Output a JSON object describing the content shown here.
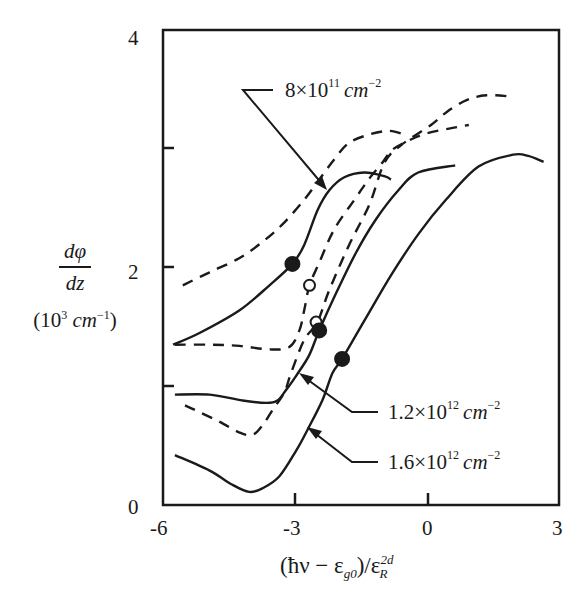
{
  "chart_data": {
    "type": "line",
    "title": "",
    "xlabel": "(ħν − ε_g0)/ε_R^2d",
    "ylabel": "dφ/dz (10^3 cm^-1)",
    "xlim": [
      -6,
      3
    ],
    "ylim": [
      0,
      4
    ],
    "x_ticks": [
      -6,
      -3,
      0,
      3
    ],
    "y_ticks": [
      0,
      1,
      2,
      3,
      4
    ],
    "x_tick_labels": [
      "-6",
      "-3",
      "0",
      "3"
    ],
    "y_tick_labels": [
      "0",
      "",
      "2",
      "",
      "4"
    ],
    "grid": false,
    "legend": "none (inline arrow annotations)",
    "annotations": [
      {
        "text": "8×10^11 cm^-2",
        "points_to": "solid-8e11 / dashed-8e11"
      },
      {
        "text": "1.2×10^12 cm^-2",
        "points_to": "solid-1.2e12"
      },
      {
        "text": "1.6×10^12 cm^-2",
        "points_to": "solid-1.6e12"
      }
    ],
    "series": [
      {
        "name": "8×10^11 cm^-2 (dashed)",
        "style": "dashed",
        "x": [
          -5.55,
          -4.94,
          -4.26,
          -3.69,
          -3.24,
          -2.79,
          -2.45,
          -2.11,
          -1.77,
          -1.31,
          -0.86,
          -0.52
        ],
        "y": [
          1.85,
          1.96,
          2.08,
          2.23,
          2.38,
          2.57,
          2.74,
          2.91,
          3.05,
          3.12,
          3.15,
          3.12
        ]
      },
      {
        "name": "8×10^11 cm^-2 (solid)",
        "style": "solid",
        "x": [
          -5.77,
          -5.16,
          -4.26,
          -3.58,
          -3.06,
          -2.79,
          -2.49,
          -2.22,
          -1.88,
          -1.43,
          -0.97,
          -0.82
        ],
        "y": [
          1.35,
          1.45,
          1.64,
          1.85,
          2.03,
          2.19,
          2.48,
          2.65,
          2.76,
          2.8,
          2.77,
          2.74
        ]
      },
      {
        "name": "1.2×10^12 cm^-2 (dashed)",
        "style": "dashed",
        "x": [
          -5.73,
          -4.94,
          -4.26,
          -3.58,
          -3.13,
          -2.9,
          -2.79,
          -2.67,
          -2.45,
          -2.11,
          -1.65,
          -1.31,
          -1.02,
          -0.79,
          -0.41,
          0.0,
          0.5,
          0.95
        ],
        "y": [
          1.35,
          1.35,
          1.34,
          1.31,
          1.33,
          1.47,
          1.64,
          1.85,
          2.04,
          2.32,
          2.57,
          2.75,
          2.88,
          2.99,
          3.07,
          3.13,
          3.17,
          3.2
        ]
      },
      {
        "name": "1.2×10^12 cm^-2 (solid)",
        "style": "solid",
        "x": [
          -5.73,
          -4.94,
          -4.19,
          -3.65,
          -3.4,
          -3.2,
          -2.97,
          -2.68,
          -2.45,
          -2.07,
          -1.62,
          -1.17,
          -0.65,
          -0.2,
          0.64
        ],
        "y": [
          0.93,
          0.93,
          0.88,
          0.86,
          0.88,
          0.97,
          1.09,
          1.26,
          1.47,
          1.78,
          2.12,
          2.4,
          2.65,
          2.8,
          2.86
        ]
      },
      {
        "name": "1.6×10^12 cm^-2 (dashed)",
        "style": "dashed",
        "x": [
          -5.5,
          -5.16,
          -4.71,
          -4.26,
          -3.97,
          -3.74,
          -3.51,
          -3.24,
          -3.09,
          -2.79,
          -2.49,
          -2.22,
          -1.77,
          -1.31,
          -0.97,
          -0.59,
          0.09,
          0.45,
          0.9,
          1.35,
          1.92
        ],
        "y": [
          0.84,
          0.78,
          0.7,
          0.61,
          0.59,
          0.67,
          0.8,
          0.95,
          1.11,
          1.39,
          1.54,
          1.81,
          2.19,
          2.53,
          2.88,
          3.03,
          3.2,
          3.31,
          3.41,
          3.45,
          3.44
        ]
      },
      {
        "name": "1.6×10^12 cm^-2 (solid)",
        "style": "solid",
        "x": [
          -5.73,
          -4.94,
          -4.42,
          -4.04,
          -3.74,
          -3.36,
          -2.97,
          -2.72,
          -2.38,
          -2.15,
          -1.93,
          -1.38,
          -0.79,
          -0.18,
          0.43,
          1.17,
          1.96,
          2.3,
          2.65
        ],
        "y": [
          0.42,
          0.29,
          0.17,
          0.11,
          0.14,
          0.24,
          0.46,
          0.63,
          0.88,
          1.11,
          1.23,
          1.58,
          1.95,
          2.29,
          2.57,
          2.85,
          2.95,
          2.94,
          2.89
        ]
      }
    ],
    "markers": [
      {
        "type": "filled",
        "x": -3.06,
        "y": 2.03
      },
      {
        "type": "open",
        "x": -2.67,
        "y": 1.85
      },
      {
        "type": "open",
        "x": -2.52,
        "y": 1.54
      },
      {
        "type": "filled",
        "x": -2.45,
        "y": 1.47
      },
      {
        "type": "filled",
        "x": -1.93,
        "y": 1.23
      }
    ]
  },
  "axes": {
    "x_ticks": [
      "-6",
      "-3",
      "0",
      "3"
    ],
    "y_ticks": [
      "0",
      "2",
      "4"
    ],
    "ylabel_num": "dφ",
    "ylabel_den": "dz",
    "ylabel_unit_pre": "(10",
    "ylabel_unit_exp": "3",
    "ylabel_unit_mid": " cm",
    "ylabel_unit_exp2": "−1",
    "ylabel_unit_post": ")",
    "xlabel_a": "(ħν − ε",
    "xlabel_sub": "g0",
    "xlabel_b": ")/ε",
    "xlabel_sup": "2d",
    "xlabel_sub2": "R"
  },
  "labels": {
    "l1_base": "8×10",
    "l1_exp": "11",
    "l1_unit": "cm",
    "l1_uexp": "−2",
    "l2_base": "1.2×10",
    "l2_exp": "12",
    "l2_unit": "cm",
    "l2_uexp": "−2",
    "l3_base": "1.6×10",
    "l3_exp": "12",
    "l3_unit": "cm",
    "l3_uexp": "−2"
  },
  "colors": {
    "ink": "#1a1a1a",
    "background": "#ffffff"
  }
}
